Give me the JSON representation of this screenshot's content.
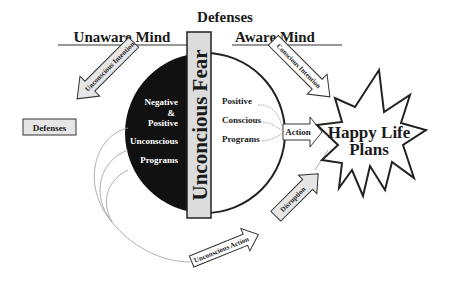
{
  "diagram": {
    "headers": {
      "defenses": "Defenses",
      "unaware_mind": "Unaware Mind",
      "aware_mind": "Aware Mind"
    },
    "central_bar": {
      "label": "Unconcious Fear"
    },
    "left_box": {
      "label": "Defenses"
    },
    "unconscious_side": {
      "lines": [
        "Negative",
        "&",
        "Positive",
        "Unconscious",
        "Programs"
      ]
    },
    "conscious_side": {
      "lines": [
        "Positive",
        "Conscious",
        "Programs"
      ]
    },
    "arrows": {
      "unconscious_intention": "Unconscious Intention",
      "conscious_intention": "Conscious Intention",
      "action": "Action",
      "unconscious_action": "Unconscious Action",
      "disruption": "Disruption"
    },
    "goal": {
      "line1": "Happy Life",
      "line2": "Plans"
    },
    "colors": {
      "arrow_fill": "#e6e6e6",
      "bar_fill": "#dcdcdc",
      "dark_half": "#111111",
      "stroke": "#222222",
      "thin_line": "#999999"
    }
  }
}
